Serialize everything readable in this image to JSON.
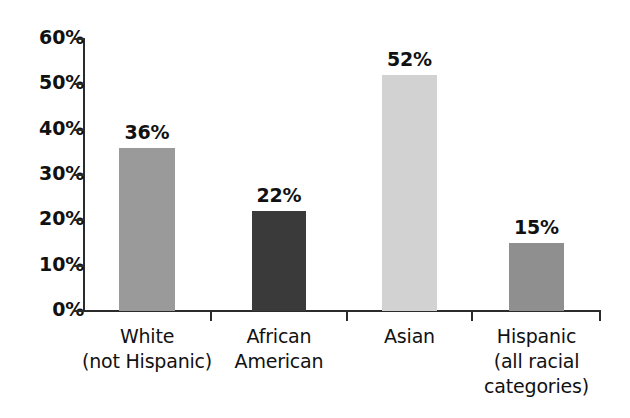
{
  "chart_data": {
    "type": "bar",
    "title": "",
    "subtitle": "",
    "xlabel": "",
    "ylabel": "",
    "categories": [
      "White (not Hispanic)",
      "African American",
      "Asian",
      "Hispanic (all racial categories)"
    ],
    "category_lines": [
      [
        "White",
        "(not Hispanic)"
      ],
      [
        "African",
        "American"
      ],
      [
        "Asian"
      ],
      [
        "Hispanic",
        "(all racial",
        "categories)"
      ]
    ],
    "values": [
      36,
      22,
      52,
      15
    ],
    "value_labels": [
      "36%",
      "22%",
      "52%",
      "15%"
    ],
    "bar_colors": [
      "#9a9a9a",
      "#3a3a3a",
      "#d2d2d2",
      "#8f8f8f"
    ],
    "ylim": [
      0,
      60
    ],
    "ytick_values": [
      0,
      10,
      20,
      30,
      40,
      50,
      60
    ],
    "ytick_labels": [
      "0%",
      "10%",
      "20%",
      "30%",
      "40%",
      "50%",
      "60%"
    ],
    "grid": false,
    "legend": "none",
    "axis_color": "#2b2b2b",
    "background_color": "#ffffff"
  }
}
